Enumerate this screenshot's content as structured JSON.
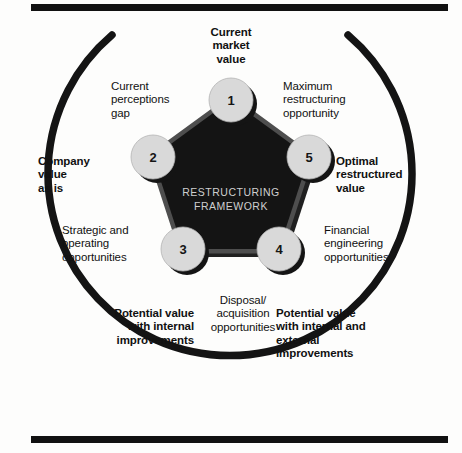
{
  "figure": {
    "center_title_line1": "RESTRUCTURING",
    "center_title_line2": "FRAMEWORK",
    "colors": {
      "rule": "#111111",
      "arc": "#141414",
      "pentagon_fill": "#141414",
      "pentagon_band": "#4e4e4e",
      "node_fill": "#d9d9d9",
      "node_shadow": "#141414",
      "text": "#111111",
      "center_text": "#cfcfcf",
      "background": "#fdfdfc"
    }
  },
  "nodes": [
    {
      "number": "1",
      "label": "Current\nmarket\nvalue",
      "emphasis": "bold",
      "align": "center"
    },
    {
      "number": "2",
      "label": "Company\nvalue\nas is",
      "emphasis": "bold",
      "align": "left"
    },
    {
      "number": "3",
      "label": "Potential value\nwith internal\nimprovements",
      "emphasis": "bold",
      "align": "right"
    },
    {
      "number": "4",
      "label": "Potential value\nwith internal and\nexternal\nimprovements",
      "emphasis": "bold",
      "align": "left"
    },
    {
      "number": "5",
      "label": "Optimal\nrestructured\nvalue",
      "emphasis": "bold",
      "align": "left"
    }
  ],
  "gap_labels": [
    {
      "id": "current-perceptions-gap",
      "text": "Current\nperceptions\ngap",
      "emphasis": "regular",
      "align": "left"
    },
    {
      "id": "maximum-restructuring-opportunity",
      "text": "Maximum\nrestructuring\nopportunity",
      "emphasis": "regular",
      "align": "left"
    },
    {
      "id": "strategic-and-operating-opportunities",
      "text": "Strategic and\noperating\nopportunities",
      "emphasis": "regular",
      "align": "left"
    },
    {
      "id": "financial-engineering-opportunities",
      "text": "Financial\nengineering\nopportunities",
      "emphasis": "regular",
      "align": "left"
    },
    {
      "id": "disposal-acquisition-opportunities",
      "text": "Disposal/\nacquisition\nopportunities",
      "emphasis": "regular",
      "align": "center"
    }
  ]
}
